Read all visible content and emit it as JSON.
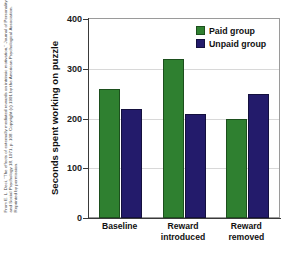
{
  "credit": {
    "text": "From E. L. Deci, \"The effects of externally mediated rewards on intrinsic motivation,\" Journal of Personality and Social Psychology 18, 1971, p. 108. Copyright (c) 1991 by the American Psychological Association. Reprinted by permission."
  },
  "chart_data": {
    "type": "bar",
    "title": "",
    "xlabel": "",
    "ylabel": "Seconds spent working on puzzle",
    "categories": [
      "Baseline",
      "Reward introduced",
      "Reward removed"
    ],
    "category_lines": [
      [
        "Baseline"
      ],
      [
        "Reward",
        "introduced"
      ],
      [
        "Reward",
        "removed"
      ]
    ],
    "series": [
      {
        "name": "Paid group",
        "color": "#2f8030",
        "values": [
          260,
          320,
          200
        ]
      },
      {
        "name": "Unpaid group",
        "color": "#231b6b",
        "values": [
          220,
          210,
          250
        ]
      }
    ],
    "ylim": [
      0,
      400
    ],
    "yticks": [
      0,
      100,
      200,
      300,
      400
    ],
    "ytick_labels": [
      "0",
      "100",
      "200",
      "300",
      "400"
    ],
    "grid": true,
    "grid_axis": "y",
    "legend_position": "top-right",
    "legend": [
      "Paid group",
      "Unpaid group"
    ]
  },
  "colors": {
    "paid": "#2f8030",
    "unpaid": "#231b6b",
    "grid": "#d8d8d8",
    "axis": "#3a3a3a",
    "background": "#ffffff"
  }
}
